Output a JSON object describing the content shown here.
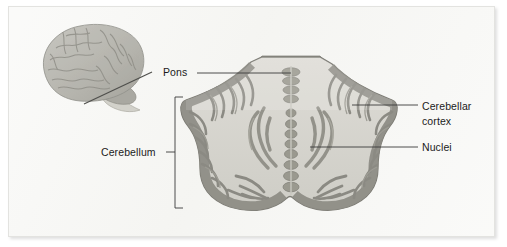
{
  "figure": {
    "background_color": "#f5f5f2",
    "panel_border_color": "#e3e3e0",
    "labels": {
      "pons": "Pons",
      "cerebellum": "Cerebellum",
      "cerebellar_cortex_line1": "Cerebellar",
      "cerebellar_cortex_line2": "cortex",
      "nuclei": "Nuclei"
    },
    "label_color": "#1b1b1b",
    "leader_line_color": "#3a3a3a",
    "inset": {
      "name": "lateral-brain-illustration",
      "cerebrum_color": "#b9b8b2",
      "cerebellum_color": "#a9a8a1",
      "brainstem_color": "#cfcec7",
      "section_plane_color": "#5a5a56"
    },
    "section": {
      "name": "cerebellum-horizontal-section",
      "white_matter_color": "#d5d4ce",
      "cortex_folia_color": "#8e8d86",
      "outline_color": "#7b7a73",
      "pons_color": "#a3a29b",
      "nuclei_color": "#9a998f"
    }
  }
}
